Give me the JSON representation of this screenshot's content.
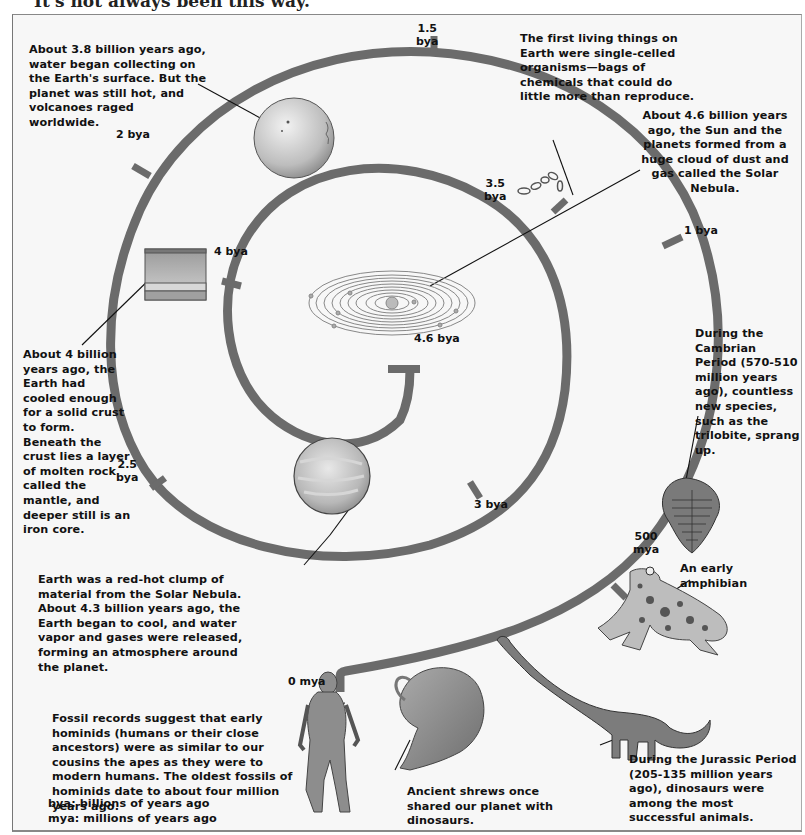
{
  "header": {
    "partial_title": "It's not always been this way."
  },
  "spiral": {
    "color": "#6b6b6b",
    "pointer_color": "#111111"
  },
  "ticks": {
    "t1_5": "1.5\nbya",
    "t1_5a": "1.5",
    "t1_5b": "bya",
    "t2": "2 bya",
    "t2_5a": "2.5",
    "t2_5b": "bya",
    "t3": "3 bya",
    "t3_5a": "3.5",
    "t3_5b": "bya",
    "t4": "4 bya",
    "t4_6": "4.6 bya",
    "t1": "1 bya",
    "t500a": "500",
    "t500b": "mya",
    "t0": "0 mya"
  },
  "captions": {
    "water": "About 3.8 billion years ago, water began collecting on the Earth's surface. But the planet was still hot, and volcanoes raged worldwide.",
    "life": "The first living things on Earth were single-celled organisms—bags of chemicals that could do little more than reproduce.",
    "nebula": "About 4.6 billion years ago, the Sun and the planets formed from a huge cloud of dust and gas called the Solar Nebula.",
    "crust": "About 4 billion years ago, the Earth had cooled enough for a solid crust to form. Beneath the crust lies a layer of molten rock called the mantle, and deeper still is an iron core.",
    "cambrian": "During the Cambrian Period (570-510 million years ago), countless new species, such as the trilobite, sprang up.",
    "redhot": "Earth was a red-hot clump of material from the Solar Nebula. About 4.3 billion years ago, the Earth began to cool, and water vapor and gases were released, forming an atmosphere around the planet.",
    "amphibian": "An early amphibian",
    "hominids": "Fossil records suggest that early hominids (humans or their close ancestors) were as similar to our cousins the apes as they were to modern humans. The oldest fossils of hominids date to about four million years ago.",
    "shrews": "Ancient shrews once shared our planet with dinosaurs.",
    "jurassic": "During the Jurassic Period (205-135 million years ago), dinosaurs were among the most successful animals."
  },
  "legend": {
    "bya": "bya: billions of years ago",
    "mya": "mya: millions of years ago"
  },
  "illustrations": [
    "early-earth-globe",
    "single-cell-organisms",
    "solar-nebula",
    "crust-cross-section",
    "red-hot-earth",
    "trilobite",
    "amphibian",
    "hominid",
    "shrew",
    "dinosaur"
  ]
}
